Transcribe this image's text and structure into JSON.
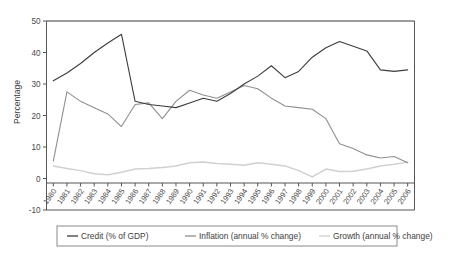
{
  "chart_data": {
    "type": "line",
    "title": "",
    "xlabel": "",
    "ylabel": "Percentage",
    "ylim": [
      -10,
      50
    ],
    "yticks": [
      -10,
      0,
      10,
      20,
      30,
      40,
      50
    ],
    "ytick_labels": [
      "-10",
      "0",
      "10",
      "20",
      "30",
      "40",
      "50"
    ],
    "grid": false,
    "legend_position": "bottom",
    "categories": [
      "1980",
      "1981",
      "1982",
      "1983",
      "1984",
      "1985",
      "1986",
      "1987",
      "1988",
      "1989",
      "1990",
      "1991",
      "1992",
      "1993",
      "1994",
      "1995",
      "1996",
      "1997",
      "1998",
      "1999",
      "2000",
      "2001",
      "2002",
      "2003",
      "2004",
      "2005",
      "2006"
    ],
    "series": [
      {
        "name": "Credit (% of GDP)",
        "color": "#3d3d3d",
        "values": [
          31.0,
          33.5,
          36.5,
          40.0,
          43.0,
          45.8,
          24.5,
          23.5,
          23.0,
          22.5,
          24.0,
          25.5,
          24.5,
          27.0,
          30.0,
          32.5,
          35.8,
          32.0,
          34.0,
          38.5,
          41.5,
          43.5,
          42.0,
          40.5,
          34.5,
          34.0,
          34.5
        ]
      },
      {
        "name": "Inflation (annual % change)",
        "color": "#8f8f8f",
        "values": [
          5.5,
          27.5,
          24.5,
          22.5,
          20.5,
          16.5,
          23.5,
          24.0,
          19.0,
          24.5,
          28.0,
          26.5,
          25.5,
          27.5,
          29.5,
          28.5,
          25.5,
          23.0,
          22.5,
          22.0,
          19.0,
          11.0,
          9.5,
          7.5,
          6.5,
          7.0,
          5.0
        ]
      },
      {
        "name": "Growth (annual % change)",
        "color": "#d0d0d0",
        "values": [
          4.0,
          3.2,
          2.5,
          1.5,
          1.2,
          2.0,
          3.0,
          3.2,
          3.5,
          4.0,
          5.0,
          5.2,
          4.8,
          4.5,
          4.2,
          5.0,
          4.5,
          4.0,
          2.5,
          0.5,
          3.0,
          2.2,
          2.3,
          3.0,
          4.0,
          4.5,
          5.2
        ]
      }
    ]
  },
  "legend": {
    "items": [
      {
        "label": "Credit (% of GDP)",
        "color": "#3d3d3d"
      },
      {
        "label": "Inflation (annual % change)",
        "color": "#8f8f8f"
      },
      {
        "label": "Growth (annual % change)",
        "color": "#d0d0d0"
      }
    ]
  }
}
